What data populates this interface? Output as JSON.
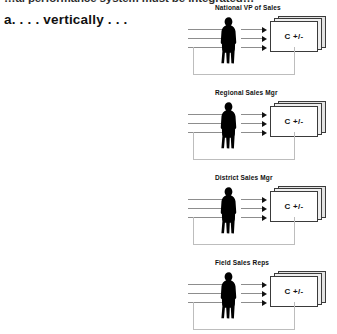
{
  "document": {
    "clipped_heading": "…al performance system must be integrated…",
    "list_item": "a. . . . vertically . . ."
  },
  "diagram": {
    "type": "vertical integration chain",
    "card_label": "C +/-",
    "arrow_count_in": 3,
    "arrow_count_out": 3,
    "colors": {
      "silhouette": "#000000",
      "arrow_line": "#8d8d8d",
      "arrow_head": "#111111",
      "card_border": "#3a3a3a",
      "card_face": "#ffffff",
      "card_shadow": "#e2e2e2",
      "loop_line": "#bdbdbd",
      "text": "#111111",
      "background": "#ffffff"
    },
    "units": [
      {
        "label": "National VP of Sales",
        "card_label": "C +/-"
      },
      {
        "label": "Regional Sales Mgr",
        "card_label": "C +/-"
      },
      {
        "label": "District Sales Mgr",
        "card_label": "C +/-"
      },
      {
        "label": "Field Sales Reps",
        "card_label": "C +/-"
      }
    ]
  }
}
